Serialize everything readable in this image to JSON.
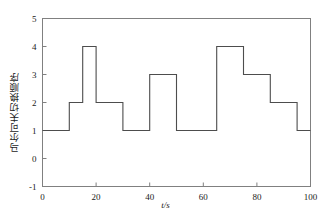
{
  "chart_data": {
    "type": "line",
    "title": "",
    "subtitle": "",
    "xlabel": "t/s",
    "ylabel": "马尔可夫切换顺序",
    "xlim": [
      0,
      100
    ],
    "ylim": [
      -1,
      5
    ],
    "xticks": [
      0,
      20,
      40,
      60,
      80,
      100
    ],
    "yticks": [
      -1,
      0,
      1,
      2,
      3,
      4,
      5
    ],
    "grid": false,
    "legend": null,
    "drawstyle": "steps-post",
    "line_color": "#4d4d4d",
    "frame_color": "#808080",
    "series": [
      {
        "name": "markov-switching-mode",
        "x": [
          0,
          10,
          15,
          20,
          30,
          40,
          50,
          65,
          75,
          85,
          95,
          100
        ],
        "values": [
          1,
          2,
          4,
          2,
          1,
          3,
          1,
          4,
          3,
          2,
          1,
          1
        ]
      }
    ],
    "segments": [
      {
        "x_start": 0,
        "x_end": 10,
        "y": 1
      },
      {
        "x_start": 10,
        "x_end": 15,
        "y": 2
      },
      {
        "x_start": 15,
        "x_end": 20,
        "y": 4
      },
      {
        "x_start": 20,
        "x_end": 30,
        "y": 2
      },
      {
        "x_start": 30,
        "x_end": 40,
        "y": 1
      },
      {
        "x_start": 40,
        "x_end": 50,
        "y": 3
      },
      {
        "x_start": 50,
        "x_end": 65,
        "y": 1
      },
      {
        "x_start": 65,
        "x_end": 75,
        "y": 4
      },
      {
        "x_start": 75,
        "x_end": 85,
        "y": 3
      },
      {
        "x_start": 85,
        "x_end": 95,
        "y": 2
      },
      {
        "x_start": 95,
        "x_end": 100,
        "y": 1
      }
    ]
  },
  "axis": {
    "xlabel": "t/s",
    "ylabel": "马尔可夫切换顺序",
    "xtick_labels": [
      "0",
      "20",
      "40",
      "60",
      "80",
      "100"
    ],
    "ytick_labels": [
      "-1",
      "0",
      "1",
      "2",
      "3",
      "4",
      "5"
    ]
  },
  "colors": {
    "line": "#4d4d4d",
    "frame": "#8c8c8c",
    "text": "#1a1a1a",
    "background": "#ffffff"
  }
}
